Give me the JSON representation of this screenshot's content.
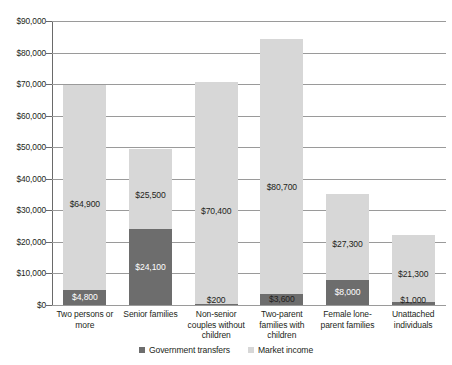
{
  "chart_data": {
    "type": "bar",
    "stacked": true,
    "title": "",
    "xlabel": "",
    "ylabel": "",
    "ylim": [
      0,
      90000
    ],
    "ytick_step": 10000,
    "grid": true,
    "legend_position": "bottom",
    "categories": [
      "Two persons or more",
      "Senior families",
      "Non-senior couples without children",
      "Two-parent families with children",
      "Female lone-parent families",
      "Unattached individuals"
    ],
    "category_label_lines": [
      [
        "Two persons or",
        "more"
      ],
      [
        "Senior families"
      ],
      [
        "Non-senior",
        "couples without",
        "children"
      ],
      [
        "Two-parent",
        "families with",
        "children"
      ],
      [
        "Female lone-",
        "parent families"
      ],
      [
        "Unattached",
        "individuals"
      ]
    ],
    "ytick_labels": [
      "$90,000",
      "$80,000",
      "$70,000",
      "$60,000",
      "$50,000",
      "$40,000",
      "$30,000",
      "$20,000",
      "$10,000",
      "$0"
    ],
    "ytick_values": [
      90000,
      80000,
      70000,
      60000,
      50000,
      40000,
      30000,
      20000,
      10000,
      0
    ],
    "series": [
      {
        "name": "Government transfers",
        "color": "#6d6d6d",
        "values": [
          4800,
          24100,
          200,
          3600,
          8000,
          1000
        ],
        "labels": [
          "$4,800",
          "$24,100",
          "$200",
          "$3,600",
          "$8,000",
          "$1,000"
        ]
      },
      {
        "name": "Market income",
        "color": "#d7d7d7",
        "values": [
          64900,
          25500,
          70400,
          80700,
          27300,
          21300
        ],
        "labels": [
          "$64,900",
          "$25,500",
          "$70,400",
          "$80,700",
          "$27,300",
          "$21,300"
        ]
      }
    ],
    "totals": [
      69700,
      49600,
      70600,
      84300,
      35300,
      22300
    ]
  },
  "legend": {
    "items": [
      {
        "label": "Government transfers",
        "color": "#6d6d6d"
      },
      {
        "label": "Market income",
        "color": "#d7d7d7"
      }
    ]
  },
  "colors": {
    "transfers": "#6d6d6d",
    "market": "#d7d7d7",
    "gridline": "#9a9a9a",
    "axis": "#6a6a6a",
    "text": "#231f20",
    "background": "#ffffff"
  }
}
